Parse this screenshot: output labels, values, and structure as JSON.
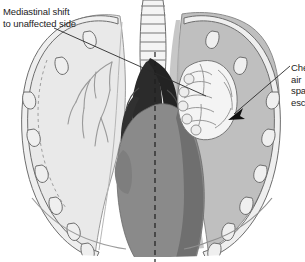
{
  "figure": {
    "kind": "medical-illustration",
    "width": 305,
    "height": 262
  },
  "labels": {
    "mediastinal": {
      "name": "mediastinal-shift-label",
      "line1": "Mediastinal shift",
      "line2": "to unaffected side"
    },
    "chestwall": {
      "name": "chest-wall-air-label",
      "line1": "Che",
      "line2": "air",
      "line3": "spa",
      "line4": "esc"
    }
  },
  "anatomy": {
    "trachea": "trachea",
    "left_lung": "left-lung-normal-aerated",
    "right_lung": "right-lung-collapsed",
    "pleural_space": "right-pleural-air-space",
    "heart": "heart-mediastinum",
    "great_vessels": "great-vessels",
    "diaphragm": "diaphragm",
    "ribs": "rib-cage",
    "midline": "midline-dashed-axis",
    "bronchi": "bronchial-tree"
  },
  "colors": {
    "background": "#ffffff",
    "lung_light": "#e9e9e9",
    "lung_light_edge": "#d2d2d2",
    "pleural_gray": "#bfbfbf",
    "heart_gray": "#8a8a8a",
    "mediastinum_dark": "#2b2b2b",
    "outline": "#6e6e6e",
    "outline_dark": "#3a3a3a",
    "text": "#1c1c1c",
    "collapsed_lung": "#f2f2f2"
  }
}
